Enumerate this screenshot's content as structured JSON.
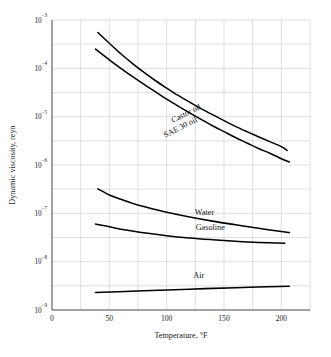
{
  "chart_data": {
    "type": "line",
    "title": "",
    "xlabel": "Temperature, °F",
    "ylabel": "Dynamic viscosity, reyn",
    "xlim": [
      0,
      225
    ],
    "ylim": [
      1e-09,
      0.001
    ],
    "yscale": "log",
    "grid": true,
    "legend_position": "inline-curve-labels",
    "x_ticks": [
      {
        "value": 0,
        "label": "0"
      },
      {
        "value": 50,
        "label": "50"
      },
      {
        "value": 100,
        "label": "100"
      },
      {
        "value": 150,
        "label": "150"
      },
      {
        "value": 200,
        "label": "200"
      }
    ],
    "x_minor_gridlines": [
      25,
      50,
      75,
      100,
      125,
      150,
      175,
      200,
      225
    ],
    "y_ticks": [
      {
        "value": 0.001,
        "mantissa": "10",
        "exponent": "−3"
      },
      {
        "value": 0.0001,
        "mantissa": "10",
        "exponent": "−4"
      },
      {
        "value": 1e-05,
        "mantissa": "10",
        "exponent": "−5"
      },
      {
        "value": 1e-06,
        "mantissa": "10",
        "exponent": "−6"
      },
      {
        "value": 1e-07,
        "mantissa": "10",
        "exponent": "−7"
      },
      {
        "value": 1e-08,
        "mantissa": "10",
        "exponent": "−8"
      },
      {
        "value": 1e-09,
        "mantissa": "10",
        "exponent": "−9"
      }
    ],
    "y_minor_gridlines": [
      0.000316,
      3.16e-05,
      3.16e-06,
      3.16e-07,
      3.16e-08,
      3.16e-09
    ],
    "series": [
      {
        "name": "Castor oil",
        "label": "Castor oil",
        "label_rotation": -27,
        "label_x": 118,
        "label_y": 1.05e-05,
        "points": [
          {
            "x": 40,
            "y": 0.00055
          },
          {
            "x": 50,
            "y": 0.00033
          },
          {
            "x": 60,
            "y": 0.0002
          },
          {
            "x": 70,
            "y": 0.000127
          },
          {
            "x": 80,
            "y": 8.3e-05
          },
          {
            "x": 90,
            "y": 5.6e-05
          },
          {
            "x": 100,
            "y": 3.9e-05
          },
          {
            "x": 110,
            "y": 2.75e-05
          },
          {
            "x": 120,
            "y": 2e-05
          },
          {
            "x": 130,
            "y": 1.47e-05
          },
          {
            "x": 140,
            "y": 1.1e-05
          },
          {
            "x": 150,
            "y": 8.3e-06
          },
          {
            "x": 160,
            "y": 6.3e-06
          },
          {
            "x": 170,
            "y": 4.9e-06
          },
          {
            "x": 180,
            "y": 3.85e-06
          },
          {
            "x": 190,
            "y": 3.05e-06
          },
          {
            "x": 200,
            "y": 2.4e-06
          },
          {
            "x": 205,
            "y": 2e-06
          }
        ]
      },
      {
        "name": "SAE 30 oil",
        "label": "SAE 30 oil",
        "label_rotation": -27,
        "label_x": 113,
        "label_y": 5.4e-06,
        "points": [
          {
            "x": 38,
            "y": 0.00025
          },
          {
            "x": 50,
            "y": 0.00015
          },
          {
            "x": 60,
            "y": 0.0001
          },
          {
            "x": 70,
            "y": 6.8e-05
          },
          {
            "x": 80,
            "y": 4.7e-05
          },
          {
            "x": 90,
            "y": 3.3e-05
          },
          {
            "x": 100,
            "y": 2.3e-05
          },
          {
            "x": 110,
            "y": 1.65e-05
          },
          {
            "x": 120,
            "y": 1.2e-05
          },
          {
            "x": 130,
            "y": 8.8e-06
          },
          {
            "x": 140,
            "y": 6.5e-06
          },
          {
            "x": 150,
            "y": 4.9e-06
          },
          {
            "x": 160,
            "y": 3.7e-06
          },
          {
            "x": 170,
            "y": 2.85e-06
          },
          {
            "x": 180,
            "y": 2.2e-06
          },
          {
            "x": 190,
            "y": 1.75e-06
          },
          {
            "x": 200,
            "y": 1.35e-06
          },
          {
            "x": 207,
            "y": 1.15e-06
          }
        ]
      },
      {
        "name": "Water",
        "label": "Water",
        "label_rotation": 0,
        "label_x": 133,
        "label_y": 9.3e-08,
        "points": [
          {
            "x": 40,
            "y": 3.2e-07
          },
          {
            "x": 50,
            "y": 2.4e-07
          },
          {
            "x": 60,
            "y": 1.95e-07
          },
          {
            "x": 70,
            "y": 1.62e-07
          },
          {
            "x": 80,
            "y": 1.38e-07
          },
          {
            "x": 90,
            "y": 1.2e-07
          },
          {
            "x": 100,
            "y": 1.05e-07
          },
          {
            "x": 120,
            "y": 8.4e-08
          },
          {
            "x": 140,
            "y": 6.9e-08
          },
          {
            "x": 160,
            "y": 5.8e-08
          },
          {
            "x": 180,
            "y": 4.9e-08
          },
          {
            "x": 200,
            "y": 4.2e-08
          },
          {
            "x": 207,
            "y": 4e-08
          }
        ]
      },
      {
        "name": "Gasoline",
        "label": "Gasoline",
        "label_rotation": 0,
        "label_x": 138,
        "label_y": 4.5e-08,
        "points": [
          {
            "x": 38,
            "y": 6e-08
          },
          {
            "x": 50,
            "y": 5.3e-08
          },
          {
            "x": 60,
            "y": 4.7e-08
          },
          {
            "x": 70,
            "y": 4.3e-08
          },
          {
            "x": 80,
            "y": 3.95e-08
          },
          {
            "x": 100,
            "y": 3.45e-08
          },
          {
            "x": 120,
            "y": 3.1e-08
          },
          {
            "x": 140,
            "y": 2.85e-08
          },
          {
            "x": 160,
            "y": 2.65e-08
          },
          {
            "x": 180,
            "y": 2.5e-08
          },
          {
            "x": 203,
            "y": 2.4e-08
          }
        ]
      },
      {
        "name": "Air",
        "label": "Air",
        "label_rotation": 0,
        "label_x": 128,
        "label_y": 4.6e-09,
        "points": [
          {
            "x": 38,
            "y": 2.3e-09
          },
          {
            "x": 80,
            "y": 2.5e-09
          },
          {
            "x": 120,
            "y": 2.7e-09
          },
          {
            "x": 160,
            "y": 2.9e-09
          },
          {
            "x": 207,
            "y": 3.1e-09
          }
        ]
      }
    ]
  }
}
